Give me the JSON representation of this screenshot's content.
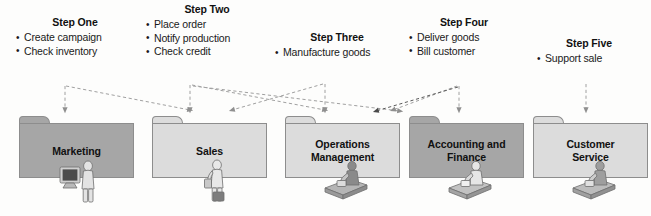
{
  "diagram": {
    "steps": [
      {
        "id": "step-one",
        "title": "Step One",
        "bullets": [
          "Create campaign",
          "Check inventory"
        ]
      },
      {
        "id": "step-two",
        "title": "Step Two",
        "bullets": [
          "Place order",
          "Notify production",
          "Check credit"
        ]
      },
      {
        "id": "step-three",
        "title": "Step Three",
        "bullets": [
          "Manufacture goods"
        ]
      },
      {
        "id": "step-four",
        "title": "Step Four",
        "bullets": [
          "Deliver goods",
          "Bill customer"
        ]
      },
      {
        "id": "step-five",
        "title": "Step Five",
        "bullets": [
          "Support sale"
        ]
      }
    ],
    "departments": [
      {
        "id": "marketing",
        "label": "Marketing",
        "shade": "dark",
        "worker": "person-at-monitor"
      },
      {
        "id": "sales",
        "label": "Sales",
        "shade": "light",
        "worker": "person-with-briefcase"
      },
      {
        "id": "operations",
        "label": "Operations\nManagement",
        "shade": "light",
        "worker": "person-at-desk"
      },
      {
        "id": "accounting",
        "label": "Accounting and\nFinance",
        "shade": "dark",
        "worker": "person-at-desk"
      },
      {
        "id": "customer",
        "label": "Customer\nService",
        "shade": "light",
        "worker": "person-at-desk"
      }
    ],
    "bullet_glyph": "•",
    "colors": {
      "folder_dark": "#a6a6a6",
      "folder_light": "#dcdcdc",
      "folder_border": "#8d8d8d",
      "arrow": "#9a9a9a",
      "text": "#111111",
      "background": "#fdfdfc"
    }
  }
}
